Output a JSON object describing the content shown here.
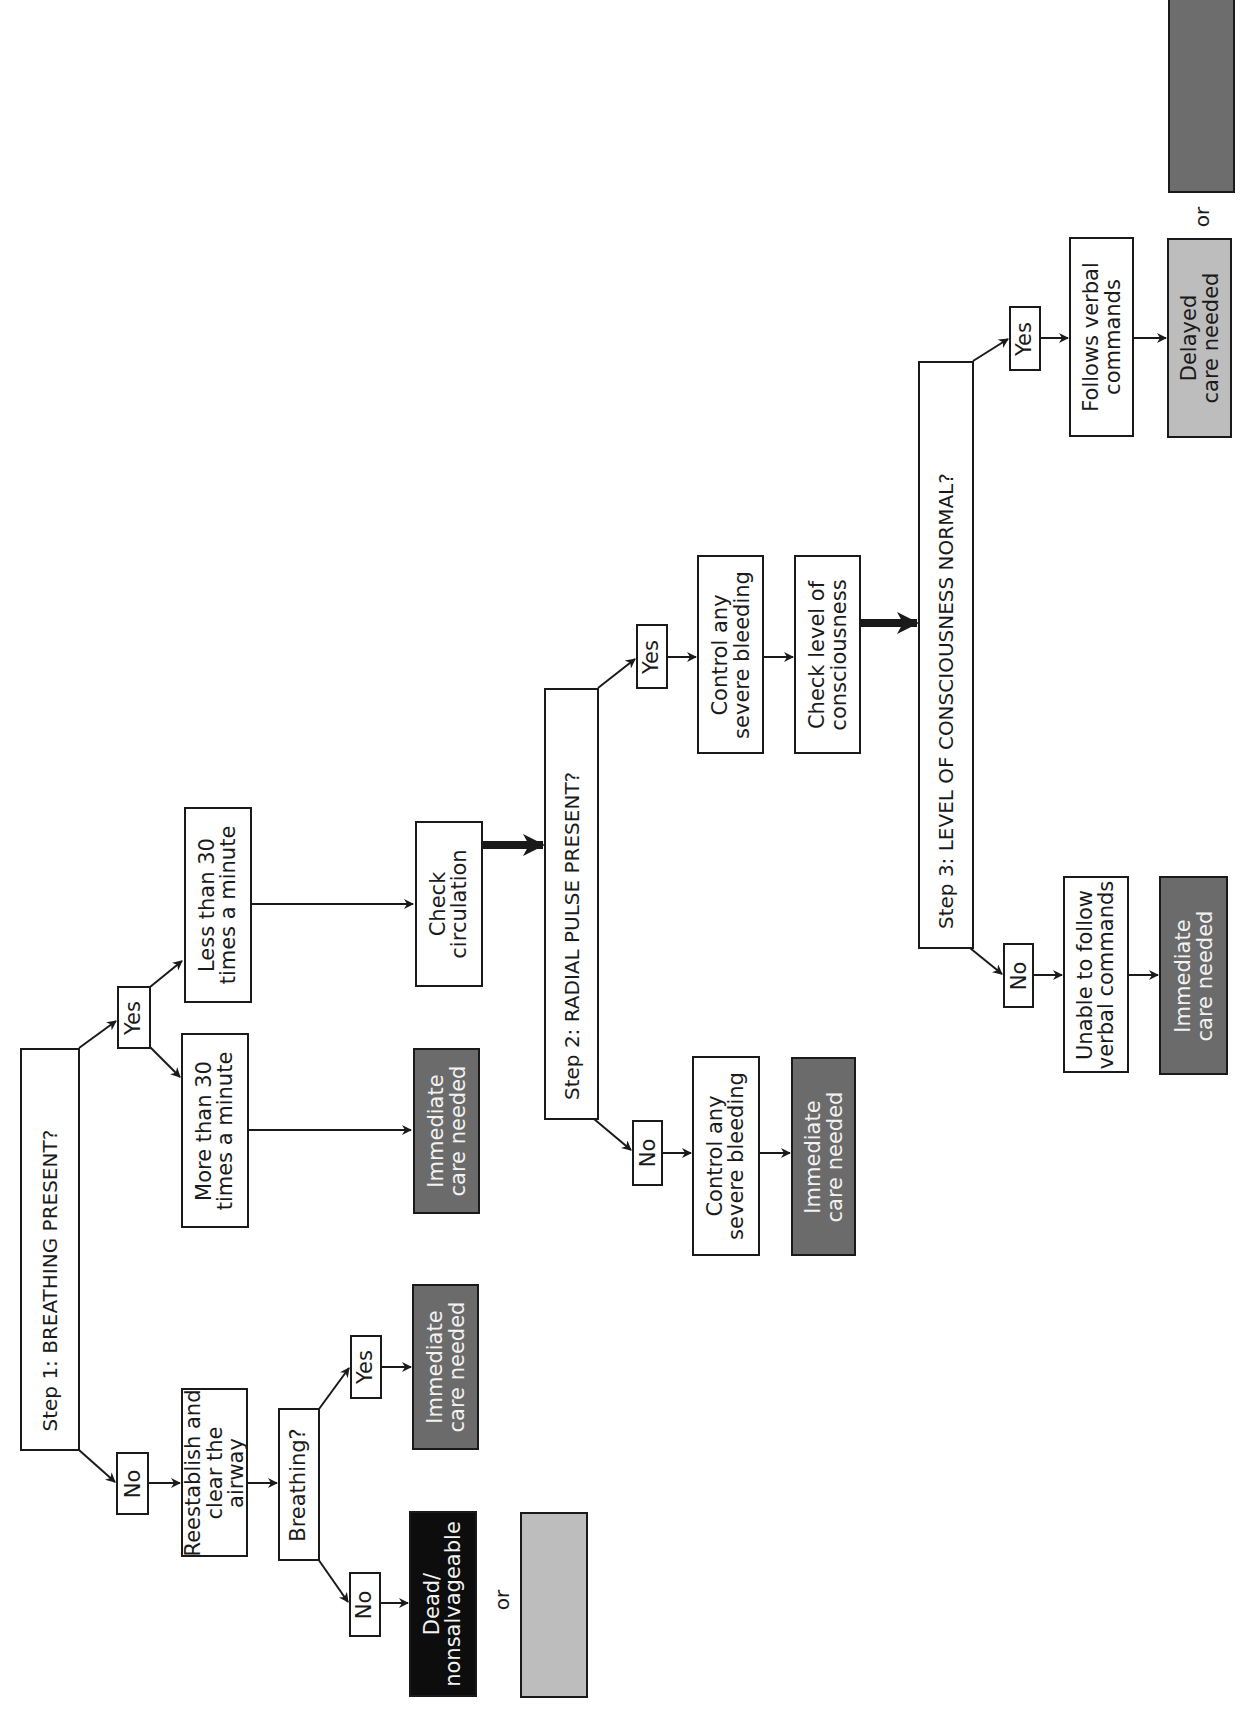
{
  "diagram": {
    "orientation": "rotated 90° counter-clockwise",
    "colors": {
      "line": "#1a1a1a",
      "immediate_fill": "#6b6b6b",
      "dead_fill": "#0d0d0d",
      "delayed_fill": "#bdbdbd",
      "legend_light_gray": "#bdbdbd",
      "legend_dark_gray": "#6d6d6d"
    },
    "step1": {
      "question": "Step 1: BREATHING PRESENT?",
      "yes_label": "Yes",
      "no_label": "No",
      "yes_branch": {
        "more_than_30": "More than 30\ntimes a minute",
        "more_than_30_outcome": "Immediate\ncare needed",
        "less_than_30": "Less than 30\ntimes a minute",
        "less_than_30_next": "Check\ncirculation"
      },
      "no_branch": {
        "action": "Reestablish and\nclear the airway",
        "question": "Breathing?",
        "yes_label": "Yes",
        "yes_outcome": "Immediate\ncare needed",
        "no_label": "No",
        "no_outcome": "Dead/\nnonsalvageable",
        "or_label": "or"
      }
    },
    "step2": {
      "question": "Step 2: RADIAL PULSE PRESENT?",
      "yes_label": "Yes",
      "no_label": "No",
      "yes_branch": {
        "action": "Control any\nsevere bleeding",
        "next": "Check level of\nconsciousness"
      },
      "no_branch": {
        "action": "Control any\nsevere bleeding",
        "outcome": "Immediate\ncare needed"
      }
    },
    "step3": {
      "question": "Step 3: LEVEL OF CONSCIOUSNESS NORMAL?",
      "yes_label": "Yes",
      "no_label": "No",
      "yes_branch": {
        "condition": "Follows verbal\ncommands",
        "outcome": "Delayed\ncare needed",
        "or_label": "or"
      },
      "no_branch": {
        "condition": "Unable to follow\nverbal commands",
        "outcome": "Immediate\ncare needed"
      }
    }
  }
}
